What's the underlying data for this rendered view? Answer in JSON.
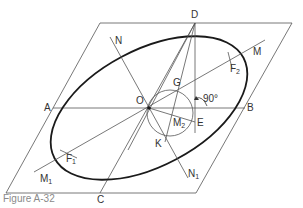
{
  "figure": {
    "caption": "Figure A-32",
    "colors": {
      "ellipse": "#1a1a1a",
      "construction_lines": "#555555",
      "labels": "#333333",
      "caption": "#8a8a8a"
    },
    "labels": {
      "A": "A",
      "B": "B",
      "C": "C",
      "D": "D",
      "E": "E",
      "G": "G",
      "K": "K",
      "M": "M",
      "M1": "M",
      "M1_sub": "1",
      "M2": "M",
      "M2_sub": "2",
      "N": "N",
      "N1": "N",
      "N1_sub": "1",
      "O": "O",
      "F1": "F",
      "F1_sub": "1",
      "F2": "F",
      "F2_sub": "2",
      "angle": "90°"
    }
  }
}
